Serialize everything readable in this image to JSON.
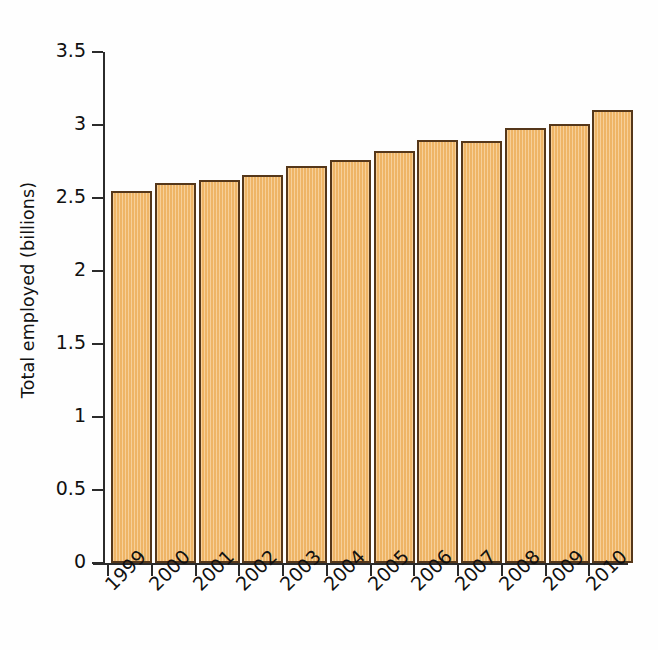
{
  "chart_data": {
    "type": "bar",
    "title": "",
    "subtitle": "",
    "xlabel": "",
    "ylabel": "Total employed (billions)",
    "categories": [
      "1999",
      "2000",
      "2001",
      "2002",
      "2003",
      "2004",
      "2005",
      "2006",
      "2007",
      "2008",
      "2009",
      "2010"
    ],
    "values": [
      2.55,
      2.6,
      2.62,
      2.66,
      2.72,
      2.76,
      2.82,
      2.9,
      2.89,
      2.98,
      3.01,
      3.1
    ],
    "series": [
      {
        "name": "Total employed (billions)",
        "values": [
          2.55,
          2.6,
          2.62,
          2.66,
          2.72,
          2.76,
          2.82,
          2.9,
          2.89,
          2.98,
          3.01,
          3.1
        ]
      }
    ],
    "ylim": [
      0,
      3.5
    ],
    "ytick_values": [
      0,
      0.5,
      1,
      1.5,
      2,
      2.5,
      3,
      3.5
    ],
    "ytick_labels": [
      "0",
      "0.5",
      "1",
      "1.5",
      "2",
      "2.5",
      "3",
      "3.5"
    ],
    "grid": false,
    "legend": false,
    "legend_position": "none",
    "xtick_label_rotation": -45,
    "annotations": [],
    "colors": {
      "bar_fill": "#f3bb6d",
      "bar_border": "#55371a",
      "axis": "#2b2b2b",
      "text": "#111111",
      "background": "#fefefe"
    }
  }
}
